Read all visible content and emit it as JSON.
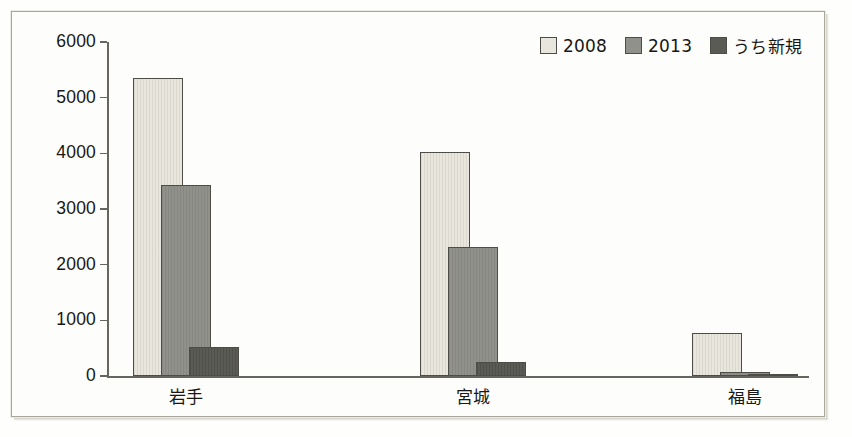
{
  "chart_data": {
    "type": "bar",
    "title": "",
    "subtitle": "",
    "xlabel": "",
    "ylabel": "",
    "categories": [
      "岩手",
      "宮城",
      "福島"
    ],
    "series": [
      {
        "name": "2008",
        "values": [
          5350,
          4020,
          775
        ],
        "color": "#e9e7dd"
      },
      {
        "name": "2013",
        "values": [
          3440,
          2320,
          70
        ],
        "color": "#91918b"
      },
      {
        "name": "うち新規",
        "values": [
          520,
          250,
          40
        ],
        "color": "#5b5b55"
      }
    ],
    "ylim": [
      0,
      6000
    ],
    "ytick_labels": [
      "6000",
      "5000",
      "4000",
      "3000",
      "2000",
      "1000",
      "0"
    ],
    "ytick_values": [
      6000,
      5000,
      4000,
      3000,
      2000,
      1000,
      0
    ],
    "grid": false,
    "legend_position": "top-right",
    "legend_orientation": "horizontal",
    "axis_color": "#66655e",
    "bar_border_color": "#4d4c46",
    "background_color": "#fdfdfb"
  }
}
